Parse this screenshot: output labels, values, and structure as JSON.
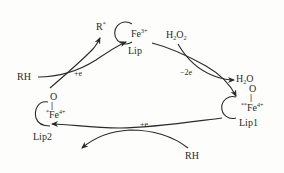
{
  "diagram": {
    "type": "catalytic-cycle",
    "nodes": {
      "lip": {
        "label": "Lip",
        "metal": "Fe",
        "charge": "3+"
      },
      "lip1": {
        "label": "Lip1",
        "oxo": "O",
        "prefix": "**",
        "metal": "Fe",
        "charge": "4+"
      },
      "lip2": {
        "label": "Lip2",
        "oxo": "O",
        "prefix": "*",
        "metal": "Fe",
        "charge": "4+"
      }
    },
    "species": {
      "h2o2": {
        "main": "H",
        "sub1": "2",
        "main2": "O",
        "sub2": "2"
      },
      "h2o": {
        "main": "H",
        "sub1": "2",
        "main2": "O"
      },
      "rh_top": "RH",
      "r_radical": {
        "main": "R",
        "sup": "*"
      },
      "rh_bottom": "RH"
    },
    "edges": [
      {
        "from": "Lip",
        "to": "Lip1",
        "label": "-2e",
        "reactant": "H2O2",
        "product": "H2O"
      },
      {
        "from": "Lip1",
        "to": "Lip2",
        "label": "+e",
        "reactant": "RH"
      },
      {
        "from": "Lip2",
        "to": "Lip",
        "label": "+e",
        "reactant": "RH",
        "product": "R*"
      }
    ],
    "labels": {
      "minus_2e": "−2e",
      "plus_e_left": "+e",
      "plus_e_bottom": "+e",
      "double_bond": "||"
    }
  }
}
